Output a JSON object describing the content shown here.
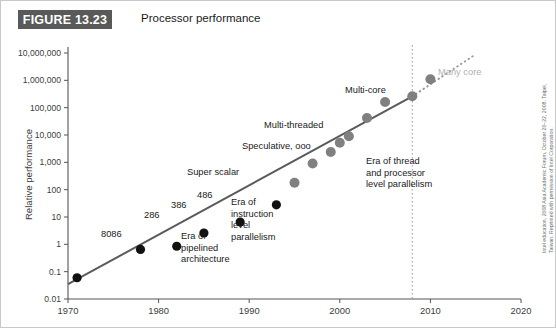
{
  "figure": {
    "badge": "FIGURE 13.23",
    "title": "Processor performance",
    "credit": "Intel education, 2008 Asia Academic Forum, October 20–22, 2008. Taipei, Taiwan. Reprinted with permission of Intel Corporation."
  },
  "colors": {
    "badge_bg": "#595959",
    "early_marker": "#111111",
    "late_marker": "#808080",
    "trend_line": "#5a5a5a",
    "projection": "#9a9a9a",
    "divider": "#9a9a9a",
    "axis": "#555555",
    "muted_text": "#b0b0b0"
  },
  "chart_data": {
    "type": "scatter",
    "title": "Processor performance",
    "xlabel": "",
    "ylabel": "Relative performance",
    "xlim": [
      1970,
      2020
    ],
    "ylim": [
      0.01,
      10000000
    ],
    "yscale": "log",
    "grid": false,
    "legend": "none",
    "xticks": [
      1970,
      1980,
      1990,
      2000,
      2010,
      2020
    ],
    "yticks": [
      0.01,
      0.1,
      1,
      10,
      100,
      1000,
      10000,
      100000,
      1000000,
      10000000
    ],
    "ytick_labels": [
      "0.01",
      "0.1",
      "1",
      "10",
      "100",
      "1,000",
      "10,000",
      "100,000",
      "1,000,000",
      "10,000,000"
    ],
    "points": [
      {
        "x": 1971,
        "y": 0.06,
        "style": "early"
      },
      {
        "x": 1978,
        "y": 0.65,
        "style": "early"
      },
      {
        "x": 1982,
        "y": 0.85,
        "style": "early"
      },
      {
        "x": 1985,
        "y": 2.6,
        "style": "early"
      },
      {
        "x": 1989,
        "y": 6.5,
        "style": "early"
      },
      {
        "x": 1993,
        "y": 28,
        "style": "early"
      },
      {
        "x": 1995,
        "y": 180,
        "style": "late"
      },
      {
        "x": 1997,
        "y": 900,
        "style": "late"
      },
      {
        "x": 1999,
        "y": 2400,
        "style": "late"
      },
      {
        "x": 2000,
        "y": 5200,
        "style": "late"
      },
      {
        "x": 2001,
        "y": 9000,
        "style": "late"
      },
      {
        "x": 2003,
        "y": 42000,
        "style": "late"
      },
      {
        "x": 2005,
        "y": 160000,
        "style": "late"
      },
      {
        "x": 2008,
        "y": 260000,
        "style": "late"
      },
      {
        "x": 2010,
        "y": 1100000,
        "style": "late"
      }
    ],
    "trend": {
      "x0": 1970,
      "y0": 0.035,
      "x1": 2008,
      "y1": 260000
    },
    "projection": {
      "x0": 2008,
      "y0": 260000,
      "x1": 2015,
      "y1": 9000000
    },
    "divider_x": 2008,
    "annotations": [
      {
        "text": "8086",
        "x": 100,
        "y": 228
      },
      {
        "text": "286",
        "x": 143,
        "y": 209
      },
      {
        "text": "386",
        "x": 170,
        "y": 199
      },
      {
        "text": "486",
        "x": 196,
        "y": 189
      },
      {
        "text": "Super scalar",
        "x": 186,
        "y": 166
      },
      {
        "text": "Speculative, ooo",
        "x": 241,
        "y": 140
      },
      {
        "text": "Multi-threaded",
        "x": 263,
        "y": 119
      },
      {
        "text": "Multi-core",
        "x": 344,
        "y": 84
      },
      {
        "text": "Many core",
        "x": 437,
        "y": 66,
        "muted": true
      },
      {
        "text": "Era of\npipelined\narchitecture",
        "x": 180,
        "y": 230
      },
      {
        "text": "Era of\ninstruction\nlevel\nparallelism",
        "x": 230,
        "y": 196
      },
      {
        "text": "Era of thread\nand processor\nlevel parallelism",
        "x": 365,
        "y": 155
      }
    ]
  }
}
